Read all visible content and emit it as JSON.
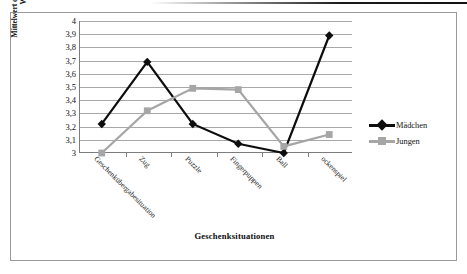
{
  "chart_data": {
    "type": "line",
    "title": "",
    "xlabel": "Geschenksituationen",
    "ylabel": "Mittelwert der Förderung kindlichen Wohlbefindens*",
    "ylabel_line1": "Mittelwert der Förderung kindlichen",
    "ylabel_line2": "Wohlbefindens*",
    "categories": [
      "Geschenkübergabesituation",
      "Zug",
      "Puzzle",
      "Fingerpuppen",
      "Ball",
      "ockenspiel"
    ],
    "series": [
      {
        "name": "Mädchen",
        "color": "#0d0d0d",
        "marker": "diamond",
        "values": [
          3.22,
          3.69,
          3.22,
          3.07,
          3.0,
          3.89
        ]
      },
      {
        "name": "Jungen",
        "color": "#a6a6a6",
        "marker": "square",
        "values": [
          3.0,
          3.32,
          3.49,
          3.48,
          3.05,
          3.14
        ]
      }
    ],
    "ylim": [
      3,
      4
    ],
    "ytick_step": 0.1,
    "ytick_labels": [
      "4",
      "3,9",
      "3,8",
      "3,7",
      "3,6",
      "3,5",
      "3,4",
      "3,3",
      "3,2",
      "3,1",
      "3"
    ],
    "ytick_values": [
      4,
      3.9,
      3.8,
      3.7,
      3.6,
      3.5,
      3.4,
      3.3,
      3.2,
      3.1,
      3
    ],
    "grid": true,
    "legend_position": "right"
  },
  "legend": {
    "entries": [
      {
        "label": "Mädchen"
      },
      {
        "label": "Jungen"
      }
    ]
  }
}
